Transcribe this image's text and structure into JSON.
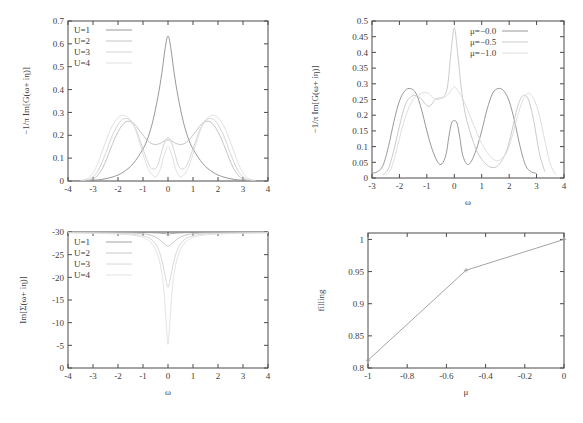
{
  "figure": {
    "background": "#ffffff",
    "axis_color": "#4a4a4a",
    "text_color": "#404040"
  },
  "panels": {
    "top_left": {
      "name": "spectral-function-vs-U",
      "ylabel": "−1/π Im[G(ω+ iη)]",
      "xlabel": "",
      "legend": [
        {
          "label": "U=1",
          "color": "#8c8c8c"
        },
        {
          "label": "U=2",
          "color": "#bdbdbd"
        },
        {
          "label": "U=3",
          "color": "#cfcfcf"
        },
        {
          "label": "U=4",
          "color": "#dcdcdc"
        }
      ],
      "xticks": [
        "-4",
        "-3",
        "-2",
        "-1",
        "0",
        "1",
        "2",
        "3",
        "4"
      ],
      "yticks": [
        "0",
        "0.1",
        "0.2",
        "0.3",
        "0.4",
        "0.5",
        "0.6",
        "0.7"
      ]
    },
    "top_right": {
      "name": "spectral-function-vs-mu",
      "ylabel": "−1/π Im[G(ω+ iη)]",
      "xlabel": "ω",
      "legend": [
        {
          "label": "μ=−0.0",
          "color": "#8c8c8c"
        },
        {
          "label": "μ=−0.5",
          "color": "#c4c4c4"
        },
        {
          "label": "μ=−1.0",
          "color": "#dadada"
        }
      ],
      "xticks": [
        "-3",
        "-2",
        "-1",
        "0",
        "1",
        "2",
        "3",
        "4"
      ],
      "yticks": [
        "0",
        "0.05",
        "0.1",
        "0.15",
        "0.2",
        "0.25",
        "0.3",
        "0.35",
        "0.4",
        "0.45",
        "0.5"
      ]
    },
    "bottom_left": {
      "name": "self-energy-vs-U",
      "ylabel": "Im[Σ(ω+ iη)]",
      "xlabel": "ω",
      "legend": [
        {
          "label": "U=1",
          "color": "#9a9a9a"
        },
        {
          "label": "U=2",
          "color": "#c2c2c2"
        },
        {
          "label": "U=3",
          "color": "#d4d4d4"
        },
        {
          "label": "U=4",
          "color": "#e0e0e0"
        }
      ],
      "xticks": [
        "-4",
        "-3",
        "-2",
        "-1",
        "0",
        "1",
        "2",
        "3",
        "4"
      ],
      "yticks": [
        "0",
        "-5",
        "-10",
        "-15",
        "-20",
        "-25",
        "-30"
      ]
    },
    "bottom_right": {
      "name": "filling-vs-mu",
      "ylabel": "filling",
      "xlabel": "μ",
      "xticks": [
        "-1",
        "-0.8",
        "-0.6",
        "-0.4",
        "-0.2",
        "0"
      ],
      "yticks": [
        "0.8",
        "0.85",
        "0.9",
        "0.95",
        "1"
      ]
    }
  },
  "chart_data": [
    {
      "type": "line",
      "panel": "top_left",
      "title": "",
      "xlabel": "",
      "ylabel": "-1/pi Im[G(w+ i eta)]",
      "xlim": [
        -4,
        4
      ],
      "ylim": [
        0,
        0.7
      ],
      "xticks": [
        -4,
        -3,
        -2,
        -1,
        0,
        1,
        2,
        3,
        4
      ],
      "yticks": [
        0,
        0.1,
        0.2,
        0.3,
        0.4,
        0.5,
        0.6,
        0.7
      ],
      "grid": false,
      "legend_position": "top-left",
      "series": [
        {
          "name": "U=1",
          "color": "#8c8c8c",
          "x": [
            -4.0,
            -3.5,
            -3.0,
            -2.6,
            -2.2,
            -1.8,
            -1.4,
            -1.0,
            -0.8,
            -0.6,
            -0.4,
            -0.25,
            -0.1,
            0.0,
            0.1,
            0.25,
            0.4,
            0.6,
            0.8,
            1.0,
            1.4,
            1.8,
            2.2,
            2.6,
            3.0,
            3.5,
            4.0
          ],
          "y": [
            0.0,
            0.001,
            0.003,
            0.008,
            0.018,
            0.038,
            0.075,
            0.14,
            0.19,
            0.265,
            0.37,
            0.47,
            0.59,
            0.635,
            0.59,
            0.47,
            0.37,
            0.265,
            0.19,
            0.14,
            0.075,
            0.038,
            0.018,
            0.008,
            0.003,
            0.001,
            0.0
          ]
        },
        {
          "name": "U=2",
          "color": "#bdbdbd",
          "x": [
            -3.2,
            -2.9,
            -2.6,
            -2.3,
            -2.0,
            -1.7,
            -1.4,
            -1.1,
            -0.8,
            -0.55,
            -0.3,
            -0.15,
            0.0,
            0.15,
            0.3,
            0.55,
            0.8,
            1.1,
            1.4,
            1.7,
            2.0,
            2.3,
            2.6,
            2.9,
            3.2
          ],
          "y": [
            0.003,
            0.015,
            0.06,
            0.14,
            0.215,
            0.258,
            0.255,
            0.215,
            0.175,
            0.16,
            0.165,
            0.175,
            0.18,
            0.175,
            0.165,
            0.16,
            0.175,
            0.215,
            0.255,
            0.258,
            0.215,
            0.14,
            0.06,
            0.015,
            0.003
          ]
        },
        {
          "name": "U=3",
          "color": "#cfcfcf",
          "x": [
            -3.4,
            -3.1,
            -2.8,
            -2.5,
            -2.2,
            -1.9,
            -1.6,
            -1.3,
            -1.0,
            -0.7,
            -0.45,
            -0.3,
            -0.15,
            0.0,
            0.15,
            0.3,
            0.45,
            0.7,
            1.0,
            1.3,
            1.6,
            1.9,
            2.2,
            2.5,
            2.8,
            3.1,
            3.4
          ],
          "y": [
            0.002,
            0.01,
            0.045,
            0.12,
            0.205,
            0.262,
            0.272,
            0.23,
            0.14,
            0.06,
            0.06,
            0.11,
            0.165,
            0.19,
            0.165,
            0.11,
            0.06,
            0.06,
            0.14,
            0.23,
            0.272,
            0.262,
            0.205,
            0.12,
            0.045,
            0.01,
            0.002
          ]
        },
        {
          "name": "U=4",
          "color": "#dcdcdc",
          "x": [
            -3.5,
            -3.2,
            -2.9,
            -2.6,
            -2.3,
            -2.0,
            -1.7,
            -1.4,
            -1.1,
            -0.8,
            -0.5,
            -0.3,
            -0.15,
            0.0,
            0.15,
            0.3,
            0.5,
            0.8,
            1.1,
            1.4,
            1.7,
            2.0,
            2.3,
            2.6,
            2.9,
            3.2,
            3.5
          ],
          "y": [
            0.002,
            0.012,
            0.055,
            0.14,
            0.225,
            0.278,
            0.285,
            0.25,
            0.155,
            0.055,
            0.018,
            0.055,
            0.115,
            0.15,
            0.115,
            0.055,
            0.018,
            0.055,
            0.155,
            0.25,
            0.285,
            0.278,
            0.225,
            0.14,
            0.055,
            0.012,
            0.002
          ]
        }
      ]
    },
    {
      "type": "line",
      "panel": "top_right",
      "title": "",
      "xlabel": "w",
      "ylabel": "-1/pi Im[G(w+ i eta)]",
      "xlim": [
        -3,
        4
      ],
      "ylim": [
        0,
        0.5
      ],
      "xticks": [
        -3,
        -2,
        -1,
        0,
        1,
        2,
        3,
        4
      ],
      "yticks": [
        0,
        0.05,
        0.1,
        0.15,
        0.2,
        0.25,
        0.3,
        0.35,
        0.4,
        0.45,
        0.5
      ],
      "grid": false,
      "legend_position": "top-right",
      "series": [
        {
          "name": "μ=-0.0",
          "color": "#8c8c8c",
          "x": [
            -3.0,
            -2.8,
            -2.6,
            -2.4,
            -2.2,
            -2.0,
            -1.8,
            -1.6,
            -1.4,
            -1.2,
            -1.0,
            -0.8,
            -0.6,
            -0.45,
            -0.3,
            -0.2,
            -0.1,
            0.0,
            0.1,
            0.2,
            0.3,
            0.45,
            0.6,
            0.8,
            1.0,
            1.2,
            1.4,
            1.6,
            1.8,
            2.0,
            2.2,
            2.4,
            2.6,
            2.8,
            3.0
          ],
          "y": [
            0.015,
            0.02,
            0.04,
            0.1,
            0.18,
            0.245,
            0.278,
            0.285,
            0.27,
            0.22,
            0.15,
            0.09,
            0.05,
            0.045,
            0.075,
            0.13,
            0.175,
            0.182,
            0.175,
            0.13,
            0.075,
            0.045,
            0.05,
            0.09,
            0.15,
            0.22,
            0.27,
            0.285,
            0.278,
            0.245,
            0.18,
            0.1,
            0.04,
            0.02,
            0.015
          ]
        },
        {
          "name": "μ=-0.5",
          "color": "#c4c4c4",
          "x": [
            -2.6,
            -2.4,
            -2.2,
            -2.0,
            -1.8,
            -1.6,
            -1.4,
            -1.2,
            -1.0,
            -0.85,
            -0.7,
            -0.55,
            -0.4,
            -0.25,
            -0.12,
            0.0,
            0.12,
            0.25,
            0.4,
            0.6,
            0.8,
            1.0,
            1.3,
            1.6,
            1.9,
            2.1,
            2.3,
            2.5,
            2.7,
            2.9,
            3.1,
            3.3
          ],
          "y": [
            0.01,
            0.03,
            0.09,
            0.165,
            0.23,
            0.258,
            0.262,
            0.252,
            0.23,
            0.232,
            0.25,
            0.255,
            0.258,
            0.29,
            0.4,
            0.478,
            0.4,
            0.29,
            0.205,
            0.14,
            0.09,
            0.06,
            0.035,
            0.04,
            0.085,
            0.15,
            0.225,
            0.262,
            0.25,
            0.18,
            0.08,
            0.02
          ]
        },
        {
          "name": "μ=-1.0",
          "color": "#dadada",
          "x": [
            -2.5,
            -2.3,
            -2.1,
            -1.9,
            -1.7,
            -1.5,
            -1.3,
            -1.1,
            -0.95,
            -0.8,
            -0.65,
            -0.5,
            -0.35,
            -0.2,
            -0.1,
            0.0,
            0.1,
            0.25,
            0.45,
            0.7,
            1.0,
            1.3,
            1.6,
            1.9,
            2.1,
            2.3,
            2.5,
            2.7,
            2.9,
            3.1,
            3.3,
            3.5,
            3.7
          ],
          "y": [
            0.008,
            0.03,
            0.09,
            0.16,
            0.215,
            0.25,
            0.265,
            0.272,
            0.27,
            0.258,
            0.25,
            0.252,
            0.258,
            0.268,
            0.282,
            0.29,
            0.282,
            0.262,
            0.225,
            0.17,
            0.11,
            0.07,
            0.055,
            0.08,
            0.13,
            0.195,
            0.248,
            0.27,
            0.252,
            0.2,
            0.12,
            0.045,
            0.01
          ]
        }
      ]
    },
    {
      "type": "line",
      "panel": "bottom_left",
      "title": "",
      "xlabel": "w",
      "ylabel": "Im[Sigma(w+ i eta)]",
      "xlim": [
        -4,
        4
      ],
      "ylim": [
        -30,
        0
      ],
      "xticks": [
        -4,
        -3,
        -2,
        -1,
        0,
        1,
        2,
        3,
        4
      ],
      "yticks": [
        -30,
        -25,
        -20,
        -15,
        -10,
        -5,
        0
      ],
      "grid": false,
      "legend_position": "top-left",
      "series": [
        {
          "name": "U=1",
          "color": "#9a9a9a",
          "x": [
            -4.0,
            -2.0,
            -1.0,
            -0.5,
            -0.2,
            -0.05,
            0.0,
            0.05,
            0.2,
            0.5,
            1.0,
            2.0,
            4.0
          ],
          "y": [
            -0.05,
            -0.08,
            -0.12,
            -0.2,
            -0.32,
            -0.42,
            -0.45,
            -0.42,
            -0.32,
            -0.2,
            -0.12,
            -0.08,
            -0.05
          ]
        },
        {
          "name": "U=2",
          "color": "#c2c2c2",
          "x": [
            -4.0,
            -2.0,
            -1.2,
            -0.8,
            -0.5,
            -0.3,
            -0.15,
            -0.05,
            0.0,
            0.05,
            0.15,
            0.3,
            0.5,
            0.8,
            1.2,
            2.0,
            4.0
          ],
          "y": [
            -0.1,
            -0.18,
            -0.3,
            -0.55,
            -1.1,
            -1.9,
            -2.6,
            -3.0,
            -3.1,
            -3.0,
            -2.6,
            -1.9,
            -1.1,
            -0.55,
            -0.3,
            -0.18,
            -0.1
          ]
        },
        {
          "name": "U=3",
          "color": "#d4d4d4",
          "x": [
            -4.0,
            -2.5,
            -1.5,
            -1.0,
            -0.7,
            -0.5,
            -0.35,
            -0.22,
            -0.12,
            -0.05,
            0.0,
            0.05,
            0.12,
            0.22,
            0.35,
            0.5,
            0.7,
            1.0,
            1.5,
            2.5,
            4.0
          ],
          "y": [
            -0.15,
            -0.25,
            -0.45,
            -0.85,
            -1.5,
            -2.6,
            -4.3,
            -6.8,
            -9.5,
            -11.5,
            -12.2,
            -11.5,
            -9.5,
            -6.8,
            -4.3,
            -2.6,
            -1.5,
            -0.85,
            -0.45,
            -0.25,
            -0.15
          ]
        },
        {
          "name": "U=4",
          "color": "#e0e0e0",
          "x": [
            -4.0,
            -2.5,
            -1.5,
            -1.0,
            -0.7,
            -0.5,
            -0.38,
            -0.28,
            -0.2,
            -0.14,
            -0.09,
            -0.05,
            -0.02,
            0.0,
            0.02,
            0.05,
            0.09,
            0.14,
            0.2,
            0.28,
            0.38,
            0.5,
            0.7,
            1.0,
            1.5,
            2.5,
            4.0
          ],
          "y": [
            -0.2,
            -0.35,
            -0.65,
            -1.2,
            -2.2,
            -3.8,
            -5.6,
            -8.0,
            -11.0,
            -14.5,
            -18.5,
            -21.8,
            -24.2,
            -24.8,
            -24.2,
            -21.8,
            -18.5,
            -14.5,
            -11.0,
            -8.0,
            -5.6,
            -3.8,
            -2.2,
            -1.2,
            -0.65,
            -0.35,
            -0.2
          ]
        }
      ]
    },
    {
      "type": "line",
      "panel": "bottom_right",
      "title": "",
      "xlabel": "mu",
      "ylabel": "filling",
      "xlim": [
        -1,
        0
      ],
      "ylim": [
        0.8,
        1.01
      ],
      "xticks": [
        -1,
        -0.8,
        -0.6,
        -0.4,
        -0.2,
        0
      ],
      "yticks": [
        0.8,
        0.85,
        0.9,
        0.95,
        1
      ],
      "grid": false,
      "legend_position": "none",
      "series": [
        {
          "name": "filling",
          "color": "#9a9a9a",
          "x": [
            -1.0,
            -0.5,
            0.0
          ],
          "y": [
            0.812,
            0.952,
            1.0
          ]
        }
      ]
    }
  ]
}
